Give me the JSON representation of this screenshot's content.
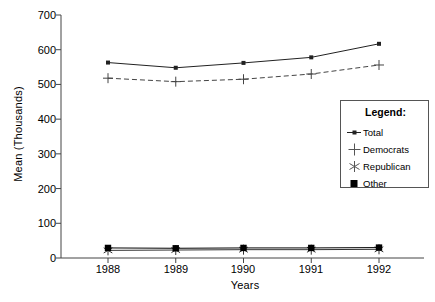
{
  "chart_data": {
    "type": "line",
    "title": "",
    "xlabel": "Years",
    "ylabel": "Mean (Thousands)",
    "categories": [
      "1988",
      "1989",
      "1990",
      "1991",
      "1992"
    ],
    "x": [
      1988,
      1989,
      1990,
      1991,
      1992
    ],
    "ylim": [
      0,
      700
    ],
    "yticks": [
      0,
      100,
      200,
      300,
      400,
      500,
      600,
      700
    ],
    "ytick_labels": [
      "0",
      "100",
      "200",
      "300",
      "400",
      "500",
      "600",
      "700"
    ],
    "grid": false,
    "legend_position": "inside-right",
    "legend_title": "Legend:",
    "series": [
      {
        "name": "Total",
        "marker": "square-dot",
        "line_style": "solid",
        "color": "#222222",
        "values": [
          563,
          548,
          562,
          578,
          617
        ]
      },
      {
        "name": "Democrats",
        "marker": "plus",
        "line_style": "dashed",
        "color": "#444444",
        "values": [
          518,
          508,
          515,
          530,
          556
        ]
      },
      {
        "name": "Republican",
        "marker": "asterisk",
        "line_style": "solid",
        "color": "#333333",
        "values": [
          22,
          23,
          24,
          24,
          25
        ]
      },
      {
        "name": "Other",
        "marker": "filled-square",
        "line_style": "solid",
        "color": "#000000",
        "values": [
          29,
          28,
          29,
          29,
          30
        ]
      }
    ]
  },
  "axes": {
    "y_title": "Mean (Thousands)",
    "x_title": "Years"
  },
  "legend": {
    "title": "Legend:",
    "items": [
      {
        "label": "Total",
        "icon": "square-dot-marker-icon"
      },
      {
        "label": "Democrats",
        "icon": "plus-marker-icon"
      },
      {
        "label": "Republican",
        "icon": "asterisk-marker-icon"
      },
      {
        "label": "Other",
        "icon": "filled-square-marker-icon"
      }
    ]
  }
}
